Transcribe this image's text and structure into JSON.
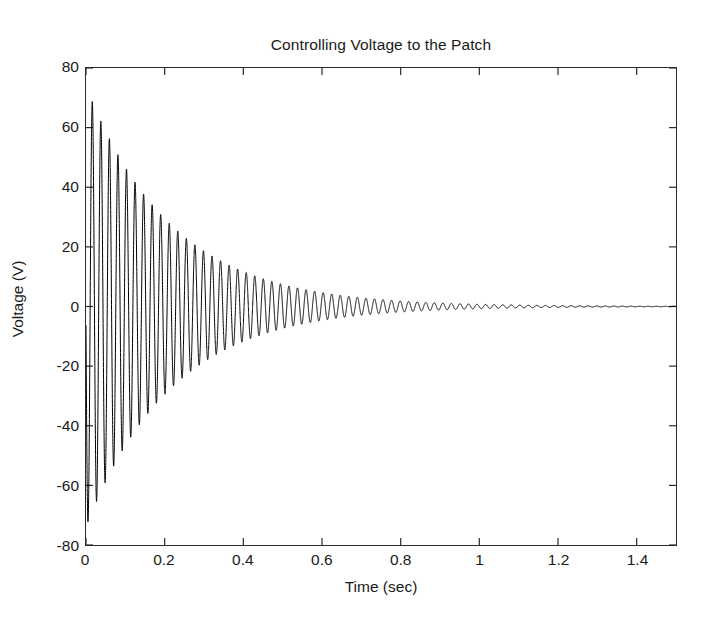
{
  "chart_data": {
    "type": "line",
    "title": "Controlling Voltage to the Patch",
    "xlabel": "Time (sec)",
    "ylabel": "Voltage (V)",
    "xlim": [
      0,
      1.5
    ],
    "ylim": [
      -80,
      80
    ],
    "grid": false,
    "legend": null,
    "legend_position": "none",
    "xticks": [
      0,
      0.2,
      0.4,
      0.6,
      0.8,
      1,
      1.2,
      1.4
    ],
    "xtick_labels": [
      "0",
      "0.2",
      "0.4",
      "0.6",
      "0.8",
      "1",
      "1.2",
      "1.4"
    ],
    "yticks": [
      -80,
      -60,
      -40,
      -20,
      0,
      20,
      40,
      60,
      80
    ],
    "ytick_labels": [
      "-80",
      "-60",
      "-40",
      "-20",
      "0",
      "20",
      "40",
      "60",
      "80"
    ],
    "tick_direction": "in",
    "line_color": "#000000",
    "line_width": 1,
    "series": [
      {
        "name": "Controlling voltage",
        "description": "Exponentially decaying sinusoid; starts with a large negative transient near t=0 reaching about -72 V, rebounds to a positive peak near 70 V, then the envelope decays toward 0 V by t=1.5 s.",
        "model": "damped_sinusoid",
        "amplitude": 74,
        "frequency_hz": 46,
        "decay_constant": 4.6,
        "phase_deg": 185,
        "initial_spike_v": -72,
        "first_peak_v": 70,
        "final_value_v": 0,
        "envelope_x": [
          0,
          0.05,
          0.1,
          0.15,
          0.2,
          0.25,
          0.3,
          0.35,
          0.4,
          0.45,
          0.5,
          0.6,
          0.7,
          0.8,
          0.9,
          1.0,
          1.1,
          1.2,
          1.3,
          1.4,
          1.5
        ],
        "envelope_y": [
          72,
          60,
          48,
          40,
          33,
          27,
          22,
          18,
          15,
          12,
          10,
          6.5,
          4.5,
          3.2,
          2.3,
          1.7,
          1.3,
          1.0,
          0.8,
          0.6,
          0.5
        ]
      }
    ]
  },
  "figure": {
    "background_color": "#ffffff",
    "axis_color": "#2b2b2b",
    "text_color": "#1a1a1a"
  }
}
